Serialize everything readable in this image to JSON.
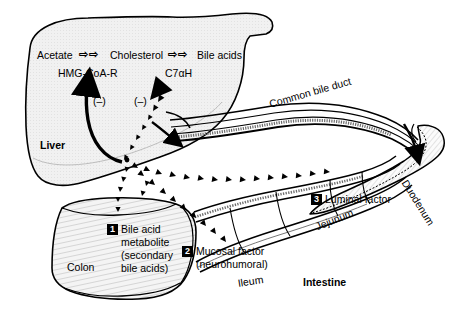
{
  "figure": {
    "background_color": "#ffffff",
    "line_color": "#000000",
    "organ_fill": "#f0f0f0"
  },
  "pathway": {
    "step1_label": "Acetate",
    "arrow1": "⇨⇨",
    "step2_label": "Cholesterol",
    "arrow2": "⇨⇨",
    "step3_label": "Bile acids",
    "enzyme1": "HMG-CoA-R",
    "enzyme2": "C7αH",
    "inhibition1": "(–)",
    "inhibition2": "(–)"
  },
  "organs": {
    "liver": "Liver",
    "colon": "Colon",
    "ileum": "Ileum",
    "jejunum": "Jejunum",
    "duodenum": "Duodenum",
    "intestine": "Intestine",
    "common_bile_duct": "Common bile duct"
  },
  "factors": [
    {
      "number": "1",
      "lines": [
        "Bile acid",
        "metabolite",
        "(secondary",
        "bile acids)"
      ],
      "text": "Bile acid metabolite (secondary bile acids)"
    },
    {
      "number": "2",
      "lines": [
        "Mucosal factor",
        "(neurohumoral)"
      ],
      "text": "Mucosal factor (neurohumoral)"
    },
    {
      "number": "3",
      "lines": [
        "Luminal factor"
      ],
      "text": "Luminal factor"
    }
  ]
}
